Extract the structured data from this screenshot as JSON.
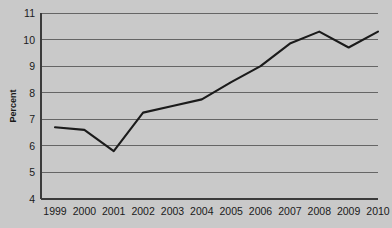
{
  "chart_data": {
    "type": "line",
    "title": "",
    "subtitle": "",
    "xlabel": "",
    "ylabel": "Percent",
    "categories": [
      "1999",
      "2000",
      "2001",
      "2002",
      "2003",
      "2004",
      "2005",
      "2006",
      "2007",
      "2008",
      "2009",
      "2010"
    ],
    "x": [
      1999,
      2000,
      2001,
      2002,
      2003,
      2004,
      2005,
      2006,
      2007,
      2008,
      2009,
      2010
    ],
    "values": [
      6.7,
      6.6,
      5.8,
      7.25,
      7.5,
      7.75,
      8.4,
      9.0,
      9.85,
      10.3,
      9.7,
      10.3
    ],
    "series": [
      {
        "name": "Percent",
        "color": "#1b1b1b",
        "values": [
          6.7,
          6.6,
          5.8,
          7.25,
          7.5,
          7.75,
          8.4,
          9.0,
          9.85,
          10.3,
          9.7,
          10.3
        ]
      }
    ],
    "ylim": [
      4,
      11
    ],
    "yticks": [
      4,
      5,
      6,
      7,
      8,
      9,
      10,
      11
    ],
    "ytick_labels": [
      "4",
      "5",
      "6",
      "7",
      "8",
      "9",
      "10",
      "11"
    ],
    "xtick_labels": [
      "1999",
      "2000",
      "2001",
      "2002",
      "2003",
      "2004",
      "2005",
      "2006",
      "2007",
      "2008",
      "2009",
      "2010"
    ],
    "grid": true,
    "grid_axis": "y",
    "legend": false,
    "legend_position": "none",
    "background_color": "#c9c9c9",
    "plot_background_color": "#c9c9c9",
    "gridline_color": "#5a5a5a",
    "axis_color": "#3a3a3a",
    "text_color": "#1a1a1a",
    "annotations": []
  }
}
